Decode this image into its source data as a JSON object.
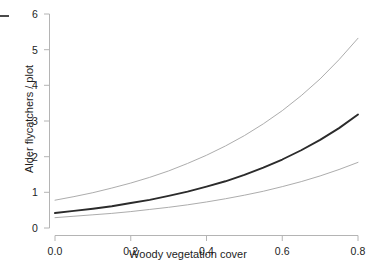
{
  "chart_data": {
    "type": "line",
    "title": "",
    "xlabel": "Woody vegetation cover",
    "ylabel": "Alder flycatchers / plot",
    "xlim": [
      0.0,
      0.8
    ],
    "ylim": [
      0.0,
      6.0
    ],
    "xticks": [
      "0.0",
      "0.2",
      "0.4",
      "0.6",
      "0.8"
    ],
    "xtick_values": [
      0.0,
      0.2,
      0.4,
      0.6,
      0.8
    ],
    "yticks": [
      "0",
      "1",
      "2",
      "3",
      "4",
      "5",
      "6"
    ],
    "ytick_values": [
      0,
      1,
      2,
      3,
      4,
      5,
      6
    ],
    "grid": false,
    "legend": null,
    "x": [
      0.0,
      0.05,
      0.1,
      0.15,
      0.2,
      0.25,
      0.3,
      0.35,
      0.4,
      0.45,
      0.5,
      0.55,
      0.6,
      0.65,
      0.7,
      0.75,
      0.8
    ],
    "series": [
      {
        "name": "Upper 95% confidence limit",
        "style": "thin-gray-line",
        "color": "#a8a8a8",
        "values": [
          0.78,
          0.88,
          0.99,
          1.12,
          1.26,
          1.42,
          1.6,
          1.81,
          2.04,
          2.3,
          2.59,
          2.92,
          3.29,
          3.71,
          4.18,
          4.72,
          5.32
        ]
      },
      {
        "name": "Fitted mean abundance",
        "style": "thick-dark-line",
        "color": "#2b2b2b",
        "values": [
          0.42,
          0.48,
          0.54,
          0.61,
          0.7,
          0.79,
          0.9,
          1.02,
          1.16,
          1.31,
          1.49,
          1.69,
          1.92,
          2.18,
          2.47,
          2.8,
          3.18
        ]
      },
      {
        "name": "Lower 95% confidence limit",
        "style": "thin-gray-line",
        "color": "#a8a8a8",
        "values": [
          0.29,
          0.33,
          0.37,
          0.41,
          0.46,
          0.52,
          0.58,
          0.65,
          0.73,
          0.82,
          0.92,
          1.03,
          1.16,
          1.3,
          1.46,
          1.64,
          1.84
        ]
      }
    ],
    "model": "exponential (log-link) regression with 95% confidence band",
    "annotations": []
  },
  "axes": {
    "y_title": "Alder flycatchers / plot",
    "x_title": "Woody vegetation cover",
    "y_tick_labels": [
      "6",
      "5",
      "4",
      "3",
      "2",
      "1",
      "0"
    ],
    "x_tick_labels": [
      "0.0",
      "0.2",
      "0.4",
      "0.6",
      "0.8"
    ]
  },
  "colors": {
    "axis": "#b4b4b4",
    "fit_line": "#2b2b2b",
    "ci_line": "#a8a8a8",
    "text": "#1d1d1d",
    "background": "#ffffff"
  }
}
